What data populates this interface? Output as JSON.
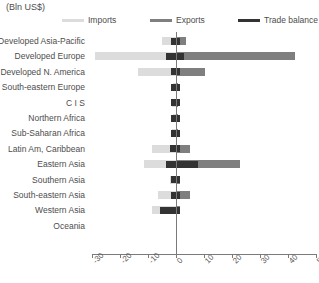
{
  "unit_label": "(Bln US$)",
  "legend": {
    "items": [
      {
        "label": "Imports",
        "color": "#dcdcdc",
        "left": 0
      },
      {
        "label": "Exports",
        "color": "#7f7f7f",
        "left": 88
      },
      {
        "label": "Trade balance",
        "color": "#333333",
        "left": 176
      }
    ]
  },
  "chart_data": {
    "type": "bar",
    "orientation": "horizontal",
    "title": "",
    "subtitle": "",
    "xlabel": "(Bln US$)",
    "ylabel": "",
    "xlim": [
      -30,
      50
    ],
    "xticks": [
      -30,
      -20,
      -10,
      0,
      10,
      20,
      30,
      40,
      50
    ],
    "xtick_labels": [
      "-30",
      "-20",
      "-10",
      "0",
      "10",
      "20",
      "30",
      "40",
      "50"
    ],
    "grid": false,
    "legend_position": "top",
    "zero_reference_line": true,
    "categories": [
      "Developed Asia-Pacific",
      "Developed Europe",
      "Developed N. America",
      "South-eastern Europe",
      "C I S",
      "Northern Africa",
      "Sub-Saharan Africa",
      "Latin Am, Caribbean",
      "Eastern Asia",
      "Southern Asia",
      "South-eastern Asia",
      "Western Asia",
      "Oceania"
    ],
    "series": [
      {
        "name": "Imports",
        "color": "#dcdcdc",
        "values": [
          -5.0,
          -29.0,
          -13.5,
          -1.0,
          -1.5,
          -1.0,
          -1.5,
          -8.5,
          -11.5,
          -2.0,
          -6.5,
          -8.5,
          0.0
        ]
      },
      {
        "name": "Exports",
        "color": "#7f7f7f",
        "values": [
          3.5,
          42.5,
          10.5,
          0.8,
          0.5,
          0.5,
          0.5,
          5.0,
          23.0,
          1.5,
          5.0,
          1.5,
          0.0
        ]
      },
      {
        "name": "Trade balance",
        "color": "#333333",
        "values": [
          -1.5,
          6.5,
          -2.5,
          -0.2,
          -1.0,
          -0.3,
          -1.0,
          -3.5,
          11.5,
          -0.4,
          -1.5,
          -7.0,
          0.0
        ]
      }
    ]
  }
}
